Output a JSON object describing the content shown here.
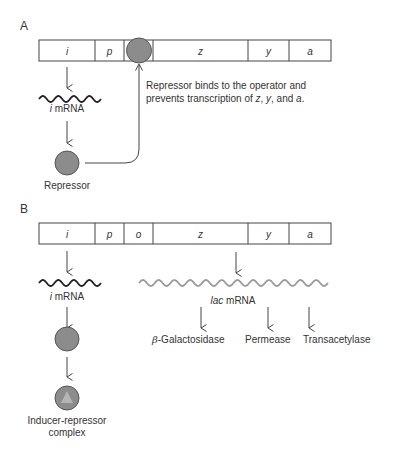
{
  "colors": {
    "line": "#444444",
    "text": "#333333",
    "protein_fill": "#8c8c8c",
    "protein_stroke": "#555555",
    "inducer_fill": "#b5b5b5",
    "lac_mrna": "#9a9a9a",
    "i_mrna": "#222222"
  },
  "panel_a": {
    "label": "A",
    "genes": [
      {
        "name": "i",
        "italic": true
      },
      {
        "name": "p",
        "italic": true
      },
      {
        "name": "",
        "italic": true,
        "note": "operator occupied by repressor"
      },
      {
        "name": "z",
        "italic": true
      },
      {
        "name": "y",
        "italic": true
      },
      {
        "name": "a",
        "italic": true
      }
    ],
    "i_mrna_label_italic": "i",
    "i_mrna_label_rest": " mRNA",
    "repressor_label": "Repressor",
    "annotation_line1": "Repressor binds to the operator and",
    "annotation_line2_pre": "prevents transcription of ",
    "annotation_z": "z",
    "annotation_sep1": ", ",
    "annotation_y": "y",
    "annotation_sep2": ", and ",
    "annotation_a": "a",
    "annotation_end": "."
  },
  "panel_b": {
    "label": "B",
    "genes": [
      {
        "name": "i"
      },
      {
        "name": "p"
      },
      {
        "name": "o"
      },
      {
        "name": "z"
      },
      {
        "name": "y"
      },
      {
        "name": "a"
      }
    ],
    "i_mrna_label_italic": "i",
    "i_mrna_label_rest": " mRNA",
    "lac_mrna_label_italic": "lac",
    "lac_mrna_label_rest": " mRNA",
    "products": [
      {
        "greek": "β",
        "rest": "-Galactosidase"
      },
      {
        "greek": "",
        "rest": "Permease"
      },
      {
        "greek": "",
        "rest": "Transacetylase"
      }
    ],
    "complex_label_line1": "Inducer-repressor",
    "complex_label_line2": "complex"
  }
}
